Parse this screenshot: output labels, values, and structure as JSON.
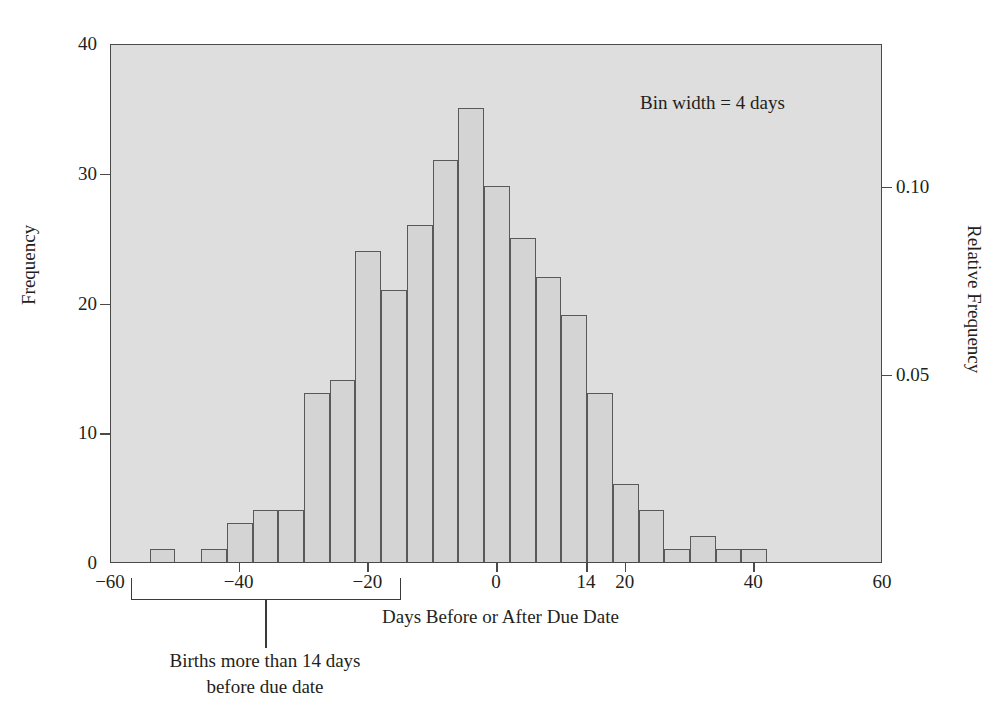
{
  "figure": {
    "annotation": "Bin width = 4 days",
    "bracket_caption_line1": "Births more than 14 days",
    "bracket_caption_line2": "before due date"
  },
  "chart_data": {
    "type": "bar",
    "title": "",
    "xlabel": "Days Before or After Due Date",
    "ylabel": "Frequency",
    "y2label": "Relative Frequency",
    "xlim": [
      -60,
      60
    ],
    "ylim": [
      0,
      40
    ],
    "y2lim": [
      0,
      0.1379
    ],
    "grid": false,
    "legend": null,
    "bin_width": 4,
    "bin_edges": [
      -54,
      -50,
      -46,
      -42,
      -38,
      -34,
      -30,
      -26,
      -22,
      -18,
      -14,
      -10,
      -6,
      -2,
      2,
      6,
      10,
      14,
      18,
      22,
      26,
      30,
      34,
      38,
      42,
      46
    ],
    "categories": [
      "-54 to -50",
      "-50 to -46",
      "-46 to -42",
      "-42 to -38",
      "-38 to -34",
      "-34 to -30",
      "-30 to -26",
      "-26 to -22",
      "-22 to -18",
      "-18 to -14",
      "-14 to -10",
      "-10 to -6",
      "-6 to -2",
      "-2 to 2",
      "2 to 6",
      "6 to 10",
      "10 to 14",
      "14 to 18",
      "18 to 22",
      "22 to 26",
      "26 to 30",
      "30 to 34",
      "34 to 38",
      "38 to 42",
      "42 to 46"
    ],
    "values": [
      1,
      0,
      1,
      3,
      4,
      4,
      13,
      14,
      24,
      21,
      26,
      31,
      35,
      29,
      25,
      22,
      19,
      13,
      6,
      4,
      1,
      2,
      1,
      1,
      0
    ],
    "xticks": [
      {
        "value": -60,
        "label": "-60"
      },
      {
        "value": -40,
        "label": "-40"
      },
      {
        "value": -20,
        "label": "-20"
      },
      {
        "value": 0,
        "label": "0"
      },
      {
        "value": 14,
        "label": "14"
      },
      {
        "value": 20,
        "label": "20"
      },
      {
        "value": 40,
        "label": "40"
      },
      {
        "value": 60,
        "label": "60"
      }
    ],
    "yticks": [
      {
        "value": 0,
        "label": "0"
      },
      {
        "value": 10,
        "label": "10"
      },
      {
        "value": 20,
        "label": "20"
      },
      {
        "value": 30,
        "label": "30"
      },
      {
        "value": 40,
        "label": "40"
      }
    ],
    "y2ticks": [
      {
        "value": 0.05,
        "label": "0.05"
      },
      {
        "value": 0.1,
        "label": "0.10"
      }
    ],
    "colors": {
      "plot_background": "#dedede",
      "bar_fill": "#d4d4d4",
      "bar_edge": "#595959",
      "axis": "#4a4a4a",
      "text": "#231f20"
    }
  }
}
